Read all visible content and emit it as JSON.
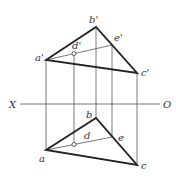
{
  "diagram": {
    "title": "",
    "axis": {
      "left_label": "X",
      "right_label": "O"
    },
    "front_view": {
      "vertices": {
        "a": "a'",
        "b": "b'",
        "c": "c'"
      },
      "points": {
        "d": "d'",
        "e": "e'"
      }
    },
    "top_view": {
      "vertices": {
        "a": "a",
        "b": "b",
        "c": "c"
      },
      "points": {
        "d": "d",
        "e": "e"
      }
    },
    "colors": {
      "line": "#222222",
      "thin_line": "#555555",
      "background": "#ffffff"
    }
  }
}
